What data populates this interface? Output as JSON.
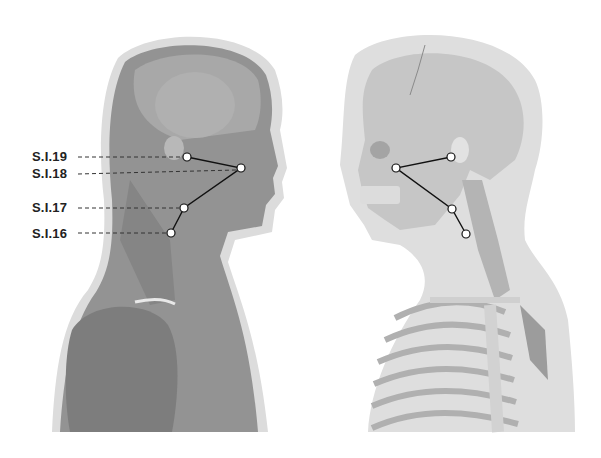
{
  "diagram": {
    "figures": [
      {
        "name": "muscle-view-figure",
        "facing": "right"
      },
      {
        "name": "skeleton-view-figure",
        "facing": "left"
      }
    ],
    "labels": [
      {
        "id": "SI19",
        "text": "S.I.19",
        "x": 32,
        "y": 150
      },
      {
        "id": "SI18",
        "text": "S.I.18",
        "x": 32,
        "y": 167
      },
      {
        "id": "SI17",
        "text": "S.I.17",
        "x": 32,
        "y": 201
      },
      {
        "id": "SI16",
        "text": "S.I.16",
        "x": 32,
        "y": 227
      }
    ],
    "colors": {
      "halo": "#d9d9d9",
      "muscle": "#8f8f8f",
      "muscle_dark": "#6e6e6e",
      "bone": "#c4c4c4",
      "bone_dark": "#9a9a9a",
      "point_fill": "#ffffff",
      "line": "#1a1a1a"
    }
  }
}
